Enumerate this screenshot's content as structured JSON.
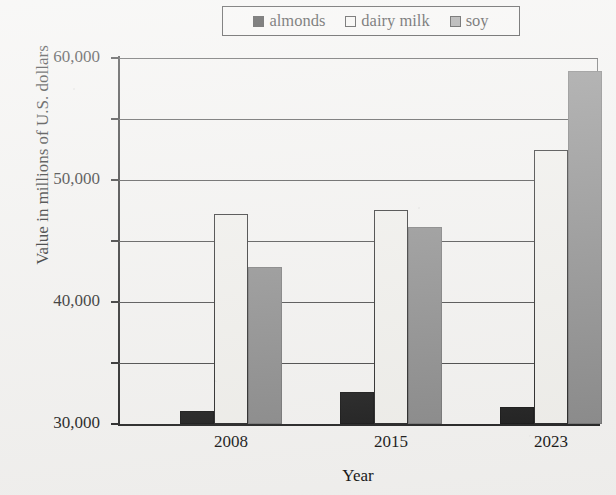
{
  "chart_data": {
    "type": "bar",
    "title": "",
    "xlabel": "Year",
    "ylabel": "Value in millions of U.S. dollars",
    "categories": [
      "2008",
      "2015",
      "2023"
    ],
    "series": [
      {
        "name": "almonds",
        "values": [
          2100,
          5200,
          2800
        ]
      },
      {
        "name": "dairy milk",
        "values": [
          34500,
          35100,
          44900
        ]
      },
      {
        "name": "soy",
        "values": [
          25800,
          32300,
          57800
        ]
      }
    ],
    "ylim": [
      0,
      60000
    ],
    "ytick_labels": [
      "0",
      "10,000",
      "20,000",
      "30,000",
      "40,000",
      "50,000",
      "60,000"
    ],
    "ytick_values": [
      0,
      10000,
      20000,
      30000,
      40000,
      50000,
      60000
    ],
    "grid": true,
    "legend_position": "top"
  },
  "legend": {
    "items": [
      {
        "label": "almonds",
        "swatch": "legend-swatch-black"
      },
      {
        "label": "dairy milk",
        "swatch": "legend-swatch-white"
      },
      {
        "label": "soy",
        "swatch": "legend-swatch-gray"
      }
    ]
  },
  "colors": {
    "almonds": "#141414",
    "dairy_milk": "#efeeea",
    "soy": "#858585",
    "axis": "#1c1c1c",
    "background": "#f2f1ef"
  }
}
